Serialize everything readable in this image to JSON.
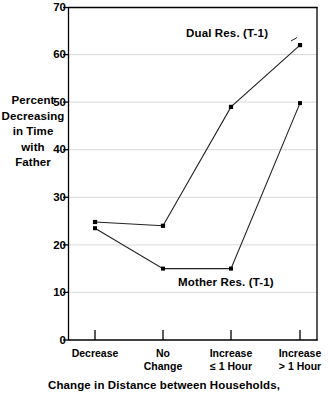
{
  "chart_data": {
    "type": "line",
    "title": "",
    "xlabel": "Change in Distance between Households,",
    "ylabel": "Percent Decreasing in Time with Father",
    "ylabel_lines": [
      "Percent",
      "Decreasing",
      "in Time",
      "with",
      "Father"
    ],
    "categories": [
      "Decrease",
      "No Change",
      "Increase ≤ 1 Hour",
      "Increase > 1 Hour"
    ],
    "category_lines": [
      [
        "Decrease"
      ],
      [
        "No",
        "Change"
      ],
      [
        "Increase",
        "≤ 1 Hour"
      ],
      [
        "Increase",
        "> 1 Hour"
      ]
    ],
    "ylim": [
      0,
      70
    ],
    "yticks": [
      0,
      10,
      20,
      30,
      40,
      50,
      60,
      70
    ],
    "ytick_labels": [
      "0",
      "10",
      "20",
      "30",
      "40",
      "50",
      "60",
      "70"
    ],
    "grid": true,
    "grid_color": "#d9d9d9",
    "legend_position": "inline-annotation",
    "line_color": "#222222",
    "marker_color": "#000000",
    "series": [
      {
        "name": "Dual Res. (T-1)",
        "label": "Dual Res. (T-1)",
        "values": [
          24.8,
          24.0,
          49.0,
          62.0
        ]
      },
      {
        "name": "Mother Res. (T-1)",
        "label": "Mother Res. (T-1)",
        "values": [
          23.5,
          15.0,
          15.0,
          49.8
        ]
      }
    ]
  },
  "axis": {
    "y": {
      "t70": "70",
      "t60": "60",
      "t50": "50",
      "t40": "40",
      "t30": "30",
      "t20": "20",
      "t10": "10",
      "t0": "0"
    }
  },
  "labels": {
    "y_line1": "Percent",
    "y_line2": "Decreasing",
    "y_line3": "in Time",
    "y_line4": "with",
    "y_line5": "Father",
    "x1_line1": "Decrease",
    "x2_line1": "No",
    "x2_line2": "Change",
    "x3_line1": "Increase",
    "x3_line2": "≤ 1 Hour",
    "x4_line1": "Increase",
    "x4_line2": "> 1 Hour",
    "series_dual": "Dual Res. (T-1)",
    "series_mother": "Mother Res. (T-1)",
    "caption": "Change in Distance between Households,"
  }
}
